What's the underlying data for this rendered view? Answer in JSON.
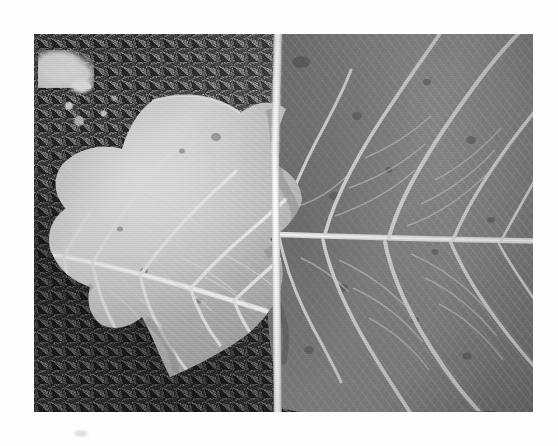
{
  "page": {
    "background_color": "#ffffff",
    "caption": "",
    "smudge_mark": "faint-grey-smudge"
  },
  "photograph": {
    "title": "Two dried leaves on gravel ground",
    "description": "Black-and-white photograph showing two dried tulip-tree style leaves laid side by side on a coarse speckled gravel or asphalt surface. A bright white petiole runs vertically down the centre of the frame.",
    "medium": "black-and-white photograph",
    "orientation": "landscape",
    "frame": {
      "left": 34,
      "top": 34,
      "width": 499,
      "height": 378
    },
    "tones": {
      "background_dark": "#4e4c4a",
      "background_mid": "#6a6965",
      "background_light_patch": "#f4f3f0",
      "left_leaf_base": "#b9b5ad",
      "left_leaf_highlight": "#ded9d0",
      "right_leaf_base": "#8d8a84",
      "right_leaf_shadow": "#5d5a55",
      "vein_color": "#e8e5de",
      "stem_color": "#ffffff"
    },
    "subjects": [
      {
        "id": "leaf-left",
        "label": "Left leaf",
        "side": "left",
        "tone": "light grey, brightly lit",
        "size": "smaller",
        "features": "pale upper surface, prominent pale midrib and secondary veins, lobed margin, a few dark spots",
        "spots": 5
      },
      {
        "id": "leaf-right",
        "label": "Right leaf",
        "side": "right",
        "tone": "darker mid grey",
        "size": "larger",
        "features": "dense reticulate venation, horizontal midrib, many fine tertiary cross-veins, scattered dark blemishes",
        "spots": 12
      },
      {
        "id": "petiole",
        "label": "Leaf stem / petiole",
        "side": "centre",
        "tone": "bright white",
        "size": "thin vertical stalk",
        "features": "runs from top edge to bottom edge of frame, slightly offset at mid-height"
      },
      {
        "id": "ground",
        "label": "Gravel ground",
        "side": "background",
        "tone": "dark speckled grey",
        "size": "full frame",
        "features": "coarse granular asphalt with a bright white chalky patch at upper left"
      }
    ]
  }
}
